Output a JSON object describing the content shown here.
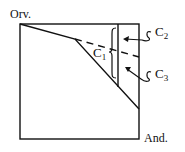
{
  "diagram": {
    "axis_labels": {
      "y_axis": "Orv.",
      "x_axis": "And."
    },
    "regions": [
      {
        "id": "C1",
        "label": "C",
        "subscript": "1"
      },
      {
        "id": "C2",
        "label": "C",
        "subscript": "2"
      },
      {
        "id": "C3",
        "label": "C",
        "subscript": "3"
      }
    ],
    "colors": {
      "stroke": "#111111",
      "background": "#ffffff"
    }
  }
}
